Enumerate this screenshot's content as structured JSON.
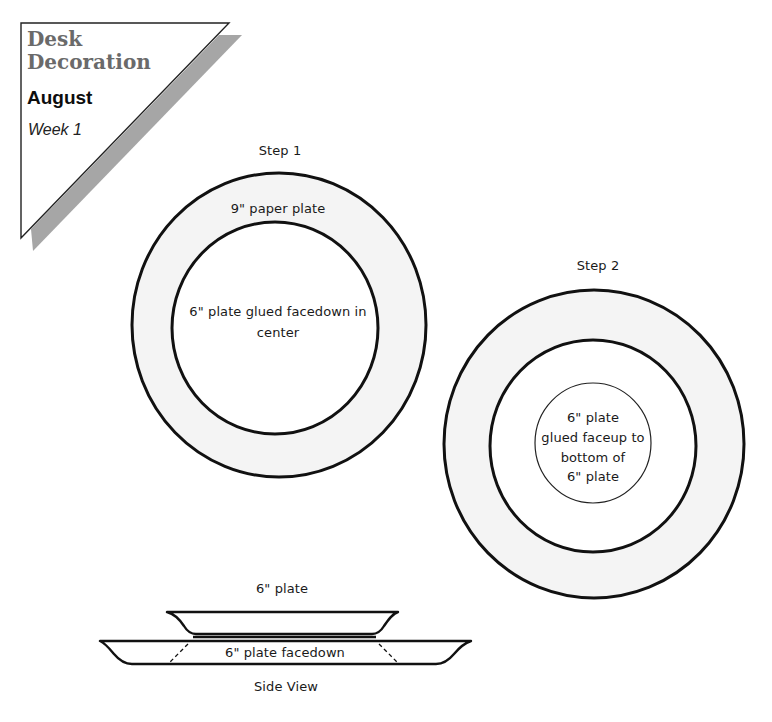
{
  "header": {
    "title_line1": "Desk",
    "title_line2": "Decoration",
    "month": "August",
    "week": "Week 1",
    "title_color": "#6a6a6a",
    "shadow_color": "#a6a6a6"
  },
  "step1": {
    "label": "Step 1",
    "outer_label": "9\" paper plate",
    "inner_label_line1": "6\" plate glued facedown in",
    "inner_label_line2": "center",
    "ring_fill": "#f4f4f4"
  },
  "step2": {
    "label": "Step 2",
    "center_label_line1": "6\" plate",
    "center_label_line2": "glued faceup to",
    "center_label_line3": "bottom of",
    "center_label_line4": "6\" plate"
  },
  "side_view": {
    "top_label": "6\" plate",
    "bottom_label": "6\" plate facedown",
    "caption": "Side View"
  }
}
